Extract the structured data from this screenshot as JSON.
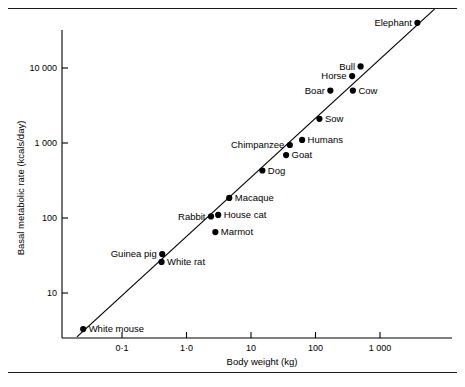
{
  "figure": {
    "name": "basal-metabolic-rate-vs-body-weight-scatter"
  },
  "chart_data": {
    "type": "scatter",
    "title": "",
    "xlabel": "Body weight (kg)",
    "ylabel": "Basal metabolic rate (kcals/day)",
    "xscale": "log",
    "yscale": "log",
    "xlim": [
      0.018,
      9000
    ],
    "ylim": [
      2.2,
      70000
    ],
    "grid": false,
    "legend": "none",
    "xticks": [
      0.1,
      1.0,
      10,
      100,
      1000
    ],
    "xticklabels": [
      "0·1",
      "1·0",
      "10",
      "100",
      "1 000"
    ],
    "yticks": [
      10,
      100,
      1000,
      10000
    ],
    "yticklabels": [
      "10",
      "100",
      "1 000",
      "10 000"
    ],
    "points": [
      {
        "label": "White mouse",
        "x": 0.025,
        "y": 3.3,
        "label_side": "right"
      },
      {
        "label": "Guinea pig",
        "x": 0.42,
        "y": 33,
        "label_side": "left"
      },
      {
        "label": "White rat",
        "x": 0.41,
        "y": 26,
        "label_side": "right"
      },
      {
        "label": "Rabbit",
        "x": 2.4,
        "y": 105,
        "label_side": "left"
      },
      {
        "label": "House cat",
        "x": 3.1,
        "y": 110,
        "label_side": "right"
      },
      {
        "label": "Marmot",
        "x": 2.8,
        "y": 65,
        "label_side": "right"
      },
      {
        "label": "Macaque",
        "x": 4.6,
        "y": 185,
        "label_side": "right"
      },
      {
        "label": "Dog",
        "x": 15,
        "y": 430,
        "label_side": "right"
      },
      {
        "label": "Goat",
        "x": 35,
        "y": 690,
        "label_side": "right"
      },
      {
        "label": "Chimpanzee",
        "x": 40,
        "y": 940,
        "label_side": "left"
      },
      {
        "label": "Humans",
        "x": 62,
        "y": 1100,
        "label_side": "right"
      },
      {
        "label": "Sow",
        "x": 115,
        "y": 2100,
        "label_side": "right"
      },
      {
        "label": "Boar",
        "x": 170,
        "y": 5000,
        "label_side": "left"
      },
      {
        "label": "Cow",
        "x": 380,
        "y": 5000,
        "label_side": "right"
      },
      {
        "label": "Horse",
        "x": 370,
        "y": 7800,
        "label_side": "left"
      },
      {
        "label": "Bull",
        "x": 500,
        "y": 10500,
        "label_side": "left"
      },
      {
        "label": "Elephant",
        "x": 3800,
        "y": 40000,
        "label_side": "left"
      }
    ],
    "fit_line": {
      "description": "allometric regression line",
      "x_start": 0.02,
      "y_start": 2.6,
      "x_end": 7000,
      "y_end": 61000
    }
  }
}
